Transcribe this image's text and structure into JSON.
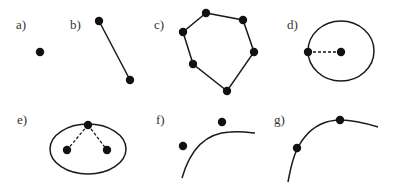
{
  "panels": [
    {
      "id": "a",
      "label": "a)",
      "description": "single point"
    },
    {
      "id": "b",
      "label": "b)",
      "description": "two points joined by a line segment"
    },
    {
      "id": "c",
      "label": "c)",
      "description": "six points forming a closed polygon (hexagon)"
    },
    {
      "id": "d",
      "label": "d)",
      "description": "circle with center point and a point on the boundary joined by dashed radius"
    },
    {
      "id": "e",
      "label": "e)",
      "description": "ellipse with two interior foci and a point on the boundary joined by dashed lines"
    },
    {
      "id": "f",
      "label": "f)",
      "description": "curve with two points lying off the curve"
    },
    {
      "id": "g",
      "label": "g)",
      "description": "curve with two points lying on the curve"
    }
  ],
  "colors": {
    "ink": "#1a1a1a",
    "label": "#333333",
    "background": "#ffffff"
  }
}
